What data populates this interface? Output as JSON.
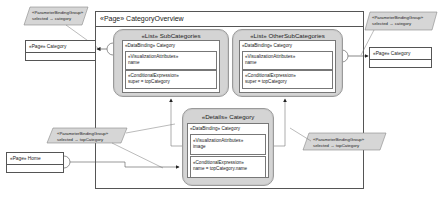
{
  "diagram": {
    "frame": {
      "title": "«Page» CategoryOverview"
    },
    "components": {
      "subcategories": {
        "title": "«List» SubCategories",
        "data_binding": "«DataBinding» Category",
        "visualization_label": "«VisualizationAttributes»",
        "visualization_value": "name",
        "conditional_label": "«ConditionalExpression»",
        "conditional_value": "super = topCategory"
      },
      "othersubcategories": {
        "title": "«List» OtherSubCategories",
        "data_binding": "«DataBinding» Category",
        "visualization_label": "«VisualizationAttributes»",
        "visualization_value": "name",
        "conditional_label": "«ConditionalExpression»",
        "conditional_value": "super = topCategory"
      },
      "details": {
        "title": "«Details» Category",
        "data_binding": "«DataBinding» Category",
        "visualization_label": "«VisualizationAttributes»",
        "visualization_value": "image",
        "conditional_label": "«ConditionalExpression»",
        "conditional_value": "name = topCategory.name"
      }
    },
    "pages": {
      "left_category": "«Page» Category",
      "right_category": "«Page» Category",
      "home": "«Page» Home"
    },
    "parameter_bindings": {
      "top_left": {
        "stereotype": "«ParameterBindingGroup»",
        "binding": "selected → category"
      },
      "top_right": {
        "stereotype": "«ParameterBindingGroup»",
        "binding": "selected → category"
      },
      "mid_left": {
        "stereotype": "«ParameterBindingGroup»",
        "binding": "selected → topCategory"
      },
      "bottom_right": {
        "stereotype": "«ParameterBindingGroup»",
        "binding": "selected → topCategory"
      }
    },
    "colors": {
      "component_fill": "#d4d4d4",
      "parameter_fill": "#d6d6d6",
      "line": "#555555"
    }
  }
}
